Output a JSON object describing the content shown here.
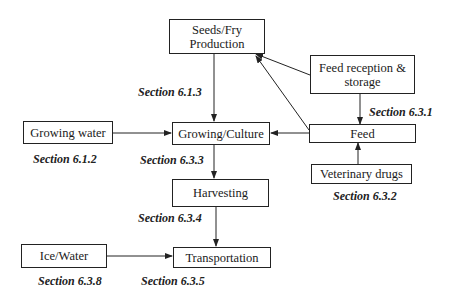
{
  "diagram": {
    "nodes": {
      "seeds": "Seeds/Fry Production",
      "growing_water": "Growing water",
      "growing_culture": "Growing/Culture",
      "feed_reception": "Feed reception & storage",
      "feed": "Feed",
      "veterinary_drugs": "Veterinary drugs",
      "harvesting": "Harvesting",
      "ice_water": "Ice/Water",
      "transportation": "Transportation"
    },
    "labels": {
      "s613": "Section 6.1.3",
      "s612": "Section 6.1.2",
      "s633": "Section 6.3.3",
      "s631": "Section 6.3.1",
      "s632": "Section 6.3.2",
      "s634": "Section 6.3.4",
      "s638": "Section 6.3.8",
      "s635": "Section 6.3.5"
    },
    "edges": [
      {
        "from": "Seeds/Fry Production",
        "to": "Growing/Culture"
      },
      {
        "from": "Growing water",
        "to": "Growing/Culture"
      },
      {
        "from": "Feed",
        "to": "Growing/Culture"
      },
      {
        "from": "Feed",
        "to": "Seeds/Fry Production"
      },
      {
        "from": "Feed reception & storage",
        "to": "Seeds/Fry Production"
      },
      {
        "from": "Feed reception & storage",
        "to": "Feed"
      },
      {
        "from": "Veterinary drugs",
        "to": "Feed"
      },
      {
        "from": "Growing/Culture",
        "to": "Harvesting"
      },
      {
        "from": "Harvesting",
        "to": "Transportation"
      },
      {
        "from": "Ice/Water",
        "to": "Transportation"
      }
    ]
  }
}
